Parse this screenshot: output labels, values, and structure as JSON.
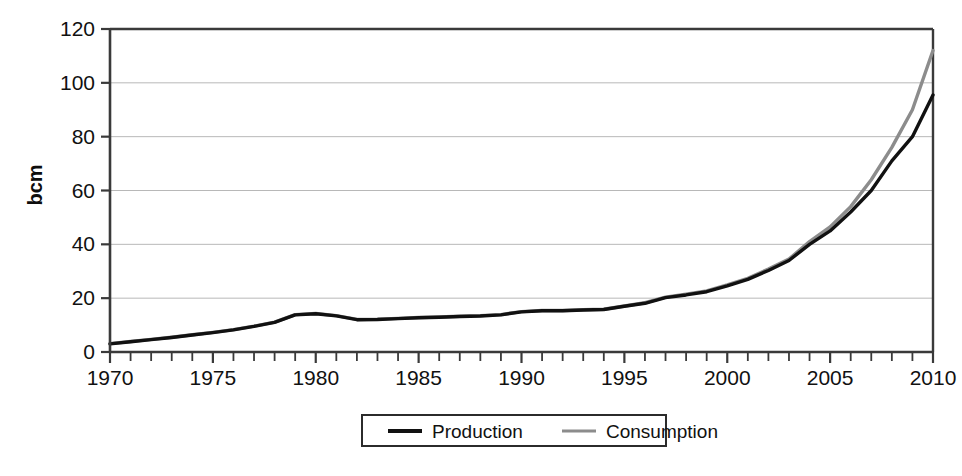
{
  "chart_data": {
    "type": "line",
    "title": "",
    "subtitle": "",
    "xlabel": "",
    "ylabel": "bcm",
    "xlim": [
      1970,
      2010
    ],
    "ylim": [
      0,
      120
    ],
    "y_ticks": [
      0,
      20,
      40,
      60,
      80,
      100,
      120
    ],
    "y_tick_labels": [
      "0",
      "20",
      "40",
      "60",
      "80",
      "100",
      "120"
    ],
    "x_ticks": [
      1970,
      1975,
      1980,
      1985,
      1990,
      1995,
      2000,
      2005,
      2010
    ],
    "x_tick_labels": [
      "1970",
      "1975",
      "1980",
      "1985",
      "1990",
      "1995",
      "2000",
      "2005",
      "2010"
    ],
    "x_minor_tick_step": 1,
    "grid": "horizontal",
    "grid_color": "#b8b8b8",
    "axis_color": "#3a3a3a",
    "legend_position": "bottom-outside",
    "x": [
      1970,
      1971,
      1972,
      1973,
      1974,
      1975,
      1976,
      1977,
      1978,
      1979,
      1980,
      1981,
      1982,
      1983,
      1984,
      1985,
      1986,
      1987,
      1988,
      1989,
      1990,
      1991,
      1992,
      1993,
      1994,
      1995,
      1996,
      1997,
      1998,
      1999,
      2000,
      2001,
      2002,
      2003,
      2004,
      2005,
      2006,
      2007,
      2008,
      2009,
      2010
    ],
    "series": [
      {
        "name": "Production",
        "color": "#111111",
        "width": 3.4,
        "values": [
          3.0,
          3.8,
          4.6,
          5.4,
          6.3,
          7.2,
          8.2,
          9.5,
          11.0,
          13.8,
          14.2,
          13.4,
          12.0,
          12.1,
          12.4,
          12.7,
          12.9,
          13.2,
          13.4,
          13.8,
          14.9,
          15.3,
          15.3,
          15.6,
          15.8,
          17.0,
          18.1,
          20.2,
          21.2,
          22.4,
          24.6,
          27.0,
          30.3,
          34.0,
          40.0,
          45.0,
          52.0,
          60.0,
          71.0,
          80.0,
          95.5
        ]
      },
      {
        "name": "Consumption",
        "color": "#8c8c8c",
        "width": 3.4,
        "values": [
          3.1,
          3.9,
          4.7,
          5.5,
          6.4,
          7.3,
          8.3,
          9.6,
          11.1,
          13.9,
          14.3,
          13.5,
          12.1,
          12.2,
          12.5,
          12.8,
          13.0,
          13.3,
          13.5,
          13.9,
          15.0,
          15.4,
          15.4,
          15.7,
          15.9,
          17.1,
          18.3,
          20.4,
          21.5,
          22.7,
          24.9,
          27.4,
          30.8,
          34.5,
          41.0,
          46.5,
          54.0,
          64.0,
          76.0,
          90.0,
          112.0
        ]
      }
    ]
  },
  "legend": {
    "items": [
      {
        "label": "Production",
        "swatch_color": "#111111"
      },
      {
        "label": "Consumption",
        "swatch_color": "#8c8c8c"
      }
    ]
  }
}
